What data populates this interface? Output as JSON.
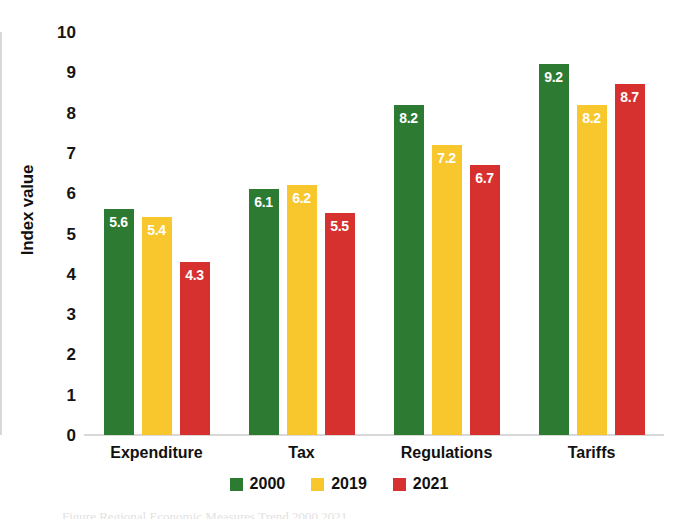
{
  "chart_data": {
    "type": "bar",
    "title": "",
    "subtitle": "",
    "xlabel": "",
    "ylabel": "Index value",
    "ylim": [
      0,
      10
    ],
    "yticks": [
      "10",
      "9",
      "8",
      "7",
      "6",
      "5",
      "4",
      "3",
      "2",
      "1",
      "0"
    ],
    "grid": false,
    "legend_position": "bottom",
    "categories": [
      "Expenditure",
      "Tax",
      "Regulations",
      "Tariffs"
    ],
    "series": [
      {
        "name": "2000",
        "color": "#2d7a32",
        "values": [
          5.6,
          6.1,
          8.2,
          9.2
        ],
        "labels": [
          "5.6",
          "6.1",
          "8.2",
          "9.2"
        ]
      },
      {
        "name": "2019",
        "color": "#f8c72e",
        "values": [
          5.4,
          6.2,
          7.2,
          8.2
        ],
        "labels": [
          "5.4",
          "6.2",
          "7.2",
          "8.2"
        ]
      },
      {
        "name": "2021",
        "color": "#d6302f",
        "values": [
          4.3,
          5.5,
          6.7,
          8.7
        ],
        "labels": [
          "4.3",
          "5.5",
          "6.7",
          "8.7"
        ]
      }
    ]
  },
  "axis": {
    "y_title": "Index value"
  },
  "legend": {
    "items": [
      {
        "label": "2000",
        "color": "#2d7a32"
      },
      {
        "label": "2019",
        "color": "#f8c72e"
      },
      {
        "label": "2021",
        "color": "#d6302f"
      }
    ]
  },
  "caption": {
    "partial_text": "Figure Regional Economic Measures Trend 2000 2021"
  }
}
